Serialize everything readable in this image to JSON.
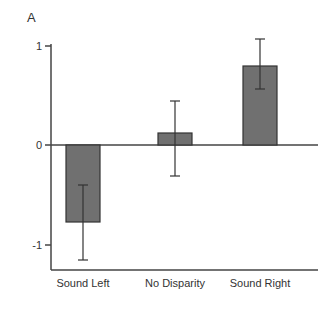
{
  "chart_data": {
    "type": "bar",
    "panel_label": "A",
    "title": "",
    "xlabel": "",
    "ylabel": "AE Ratio",
    "categories": [
      "Sound Left",
      "No Disparity",
      "Sound Right"
    ],
    "values": [
      -0.77,
      0.12,
      0.79
    ],
    "error_bars": [
      {
        "upper": -0.4,
        "lower": -1.15
      },
      {
        "upper": 0.44,
        "lower": -0.31
      },
      {
        "upper": 1.06,
        "lower": 0.56
      }
    ],
    "yticks": [
      "1",
      "0",
      "-1"
    ],
    "ylim": [
      -1.25,
      1.0
    ],
    "grid": false,
    "legend": null,
    "bar_color": "#707070",
    "bar_edge_color": "#333333"
  }
}
